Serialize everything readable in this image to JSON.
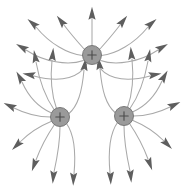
{
  "figure": {
    "background_color": "#ffffff",
    "width": 184,
    "height": 192
  },
  "style": {
    "line_color": "#a9a9a9",
    "line_width": 1.05,
    "arrow_color": "#5e5e5e",
    "charge_fill": "#9a9a9a",
    "charge_stroke": "#6f6f6f",
    "plus_sign_color": "#4a4a4a"
  },
  "charges": [
    {
      "id": "charge-top",
      "label": "+",
      "sign": "positive",
      "cx": 92,
      "cy": 55,
      "r": 9.5
    },
    {
      "id": "charge-bottom-left",
      "label": "+",
      "sign": "positive",
      "cx": 60,
      "cy": 117,
      "r": 9.5
    },
    {
      "id": "charge-bottom-right",
      "label": "+",
      "sign": "positive",
      "cx": 124,
      "cy": 116,
      "r": 9.5
    }
  ],
  "chart_data": {
    "type": "diagram",
    "charge_count": 3,
    "charge_sign": "positive",
    "arrangement": "triangle",
    "lines_per_charge": 9,
    "total_field_lines": 27,
    "field_direction": "outward",
    "grid": false,
    "legend": false,
    "axes": false,
    "lines": [
      {
        "charge": "charge-top",
        "path": "M 92 45.5 C 92 34 92 26 92 18",
        "tip": [
          92,
          16
        ],
        "angle": -90
      },
      {
        "charge": "charge-top",
        "path": "M 84.5 49.5 C 76 40 70 33 64 25",
        "tip": [
          62.5,
          23
        ],
        "angle": -128
      },
      {
        "charge": "charge-top",
        "path": "M 99.5 49.5 C 108 40 114 33 120 25",
        "tip": [
          121.5,
          23
        ],
        "angle": -52
      },
      {
        "charge": "charge-top",
        "path": "M 82.5 55.5 C 68 54 50 44 36 27",
        "tip": [
          34.5,
          25
        ],
        "angle": -140
      },
      {
        "charge": "charge-top",
        "path": "M 101.5 55.5 C 116 54 134 44 148 27",
        "tip": [
          149.5,
          25
        ],
        "angle": -40
      },
      {
        "charge": "charge-top",
        "path": "M 83.5 60.5 C 68 66 44 62 26 50",
        "tip": [
          24,
          48.5
        ],
        "angle": -150
      },
      {
        "charge": "charge-top",
        "path": "M 100.5 60.5 C 116 66 140 62 158 50",
        "tip": [
          160,
          48.5
        ],
        "angle": -30
      },
      {
        "charge": "charge-top",
        "path": "M 87 64 C 80 76 64 84 34 76",
        "tip": [
          31.5,
          75
        ],
        "angle": -170
      },
      {
        "charge": "charge-top",
        "path": "M 97 64 C 104 76 120 84 150 76",
        "tip": [
          152.5,
          75
        ],
        "angle": -10
      },
      {
        "charge": "charge-bottom-left",
        "path": "M 54 109.5 C 46 98 40 84 36 62",
        "tip": [
          35.5,
          59
        ],
        "angle": -100
      },
      {
        "charge": "charge-bottom-left",
        "path": "M 51.5 113 C 40 108 30 100 22 82",
        "tip": [
          21,
          79.5
        ],
        "angle": -120
      },
      {
        "charge": "charge-bottom-left",
        "path": "M 50.5 117 C 38 117 28 115 14 108",
        "tip": [
          12,
          107
        ],
        "angle": -155
      },
      {
        "charge": "charge-bottom-left",
        "path": "M 51 121.5 C 40 126 30 132 20 142",
        "tip": [
          18.5,
          143.5
        ],
        "angle": 135
      },
      {
        "charge": "charge-bottom-left",
        "path": "M 54.5 124.5 C 48 134 42 144 36 160",
        "tip": [
          35,
          162.5
        ],
        "angle": 110
      },
      {
        "charge": "charge-bottom-left",
        "path": "M 60 126.5 C 60 140 58 154 54 172",
        "tip": [
          53.5,
          174.5
        ],
        "angle": 95
      },
      {
        "charge": "charge-bottom-left",
        "path": "M 66.5 123.5 C 74 134 76 152 74 174",
        "tip": [
          73.5,
          176.5
        ],
        "angle": 92
      },
      {
        "charge": "charge-bottom-left",
        "path": "M 68.5 114 C 78 106 82 92 84 70",
        "tip": [
          84.5,
          67
        ],
        "angle": -82
      },
      {
        "charge": "charge-bottom-left",
        "path": "M 56.5 108.5 C 52 96 50 80 52 60",
        "tip": [
          52.5,
          57
        ],
        "angle": -85
      },
      {
        "charge": "charge-bottom-right",
        "path": "M 130 108.5 C 138 97 144 83 148 61",
        "tip": [
          148.5,
          58
        ],
        "angle": -80
      },
      {
        "charge": "charge-bottom-right",
        "path": "M 132.5 112 C 144 107 154 99 162 81",
        "tip": [
          163,
          78.5
        ],
        "angle": -60
      },
      {
        "charge": "charge-bottom-right",
        "path": "M 133.5 116 C 146 116 156 114 170 107",
        "tip": [
          172,
          106
        ],
        "angle": -25
      },
      {
        "charge": "charge-bottom-right",
        "path": "M 133 120.5 C 144 125 154 131 164 141",
        "tip": [
          165.5,
          142.5
        ],
        "angle": 45
      },
      {
        "charge": "charge-bottom-right",
        "path": "M 129.5 123.5 C 136 133 142 143 148 159",
        "tip": [
          149,
          161.5
        ],
        "angle": 70
      },
      {
        "charge": "charge-bottom-right",
        "path": "M 124 125.5 C 124 139 126 153 130 171",
        "tip": [
          130.5,
          173.5
        ],
        "angle": 85
      },
      {
        "charge": "charge-bottom-right",
        "path": "M 117.5 122.5 C 110 133 108 151 110 173",
        "tip": [
          110.5,
          175.5
        ],
        "angle": 88
      },
      {
        "charge": "charge-bottom-right",
        "path": "M 115.5 113 C 106 105 102 91 100 69",
        "tip": [
          99.5,
          66
        ],
        "angle": -98
      },
      {
        "charge": "charge-bottom-right",
        "path": "M 127.5 107.5 C 132 95 134 79 132 59",
        "tip": [
          131.5,
          56
        ],
        "angle": -95
      }
    ]
  }
}
